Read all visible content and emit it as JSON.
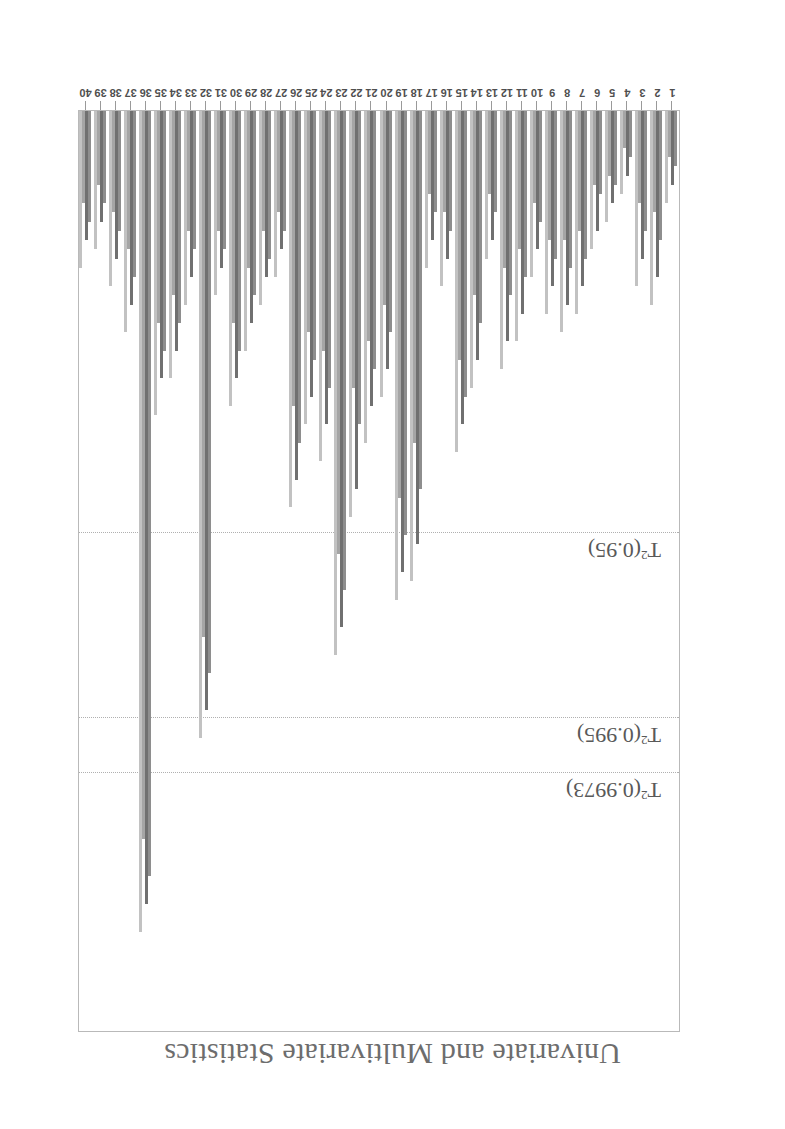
{
  "page": {
    "running_head": "Univariate and Multivariate Statistics",
    "orientation_deg": 180,
    "background": "#ffffff",
    "ink_color": "#5a5a5a"
  },
  "chart_data": {
    "type": "bar",
    "title": "",
    "subtitle": "",
    "xlabel": "",
    "ylabel": "",
    "grid": false,
    "legend_position": "none",
    "ylim": [
      0,
      100
    ],
    "xlim": [
      0.5,
      40.5
    ],
    "categories": [
      "1",
      "2",
      "3",
      "4",
      "5",
      "6",
      "7",
      "8",
      "9",
      "10",
      "11",
      "12",
      "13",
      "14",
      "15",
      "16",
      "17",
      "18",
      "19",
      "20",
      "21",
      "22",
      "23",
      "24",
      "25",
      "26",
      "27",
      "28",
      "29",
      "30",
      "31",
      "32",
      "33",
      "34",
      "35",
      "36",
      "37",
      "38",
      "39",
      "40"
    ],
    "series": [
      {
        "name": "bar-1",
        "shade": "#8e8e8e",
        "values": [
          6,
          14,
          13,
          5,
          8,
          9,
          16,
          17,
          16,
          12,
          18,
          20,
          11,
          23,
          31,
          13,
          11,
          41,
          46,
          24,
          28,
          34,
          52,
          30,
          27,
          36,
          13,
          16,
          20,
          26,
          15,
          61,
          15,
          23,
          26,
          83,
          18,
          13,
          10,
          12
        ]
      },
      {
        "name": "bar-2",
        "shade": "#707070",
        "values": [
          8,
          18,
          16,
          7,
          10,
          13,
          19,
          21,
          19,
          15,
          22,
          25,
          14,
          27,
          34,
          16,
          14,
          47,
          50,
          28,
          32,
          41,
          56,
          34,
          31,
          40,
          15,
          18,
          23,
          29,
          17,
          65,
          18,
          26,
          29,
          86,
          21,
          16,
          12,
          14
        ]
      },
      {
        "name": "bar-3",
        "shade": "#a5a5a5",
        "values": [
          5,
          11,
          10,
          4,
          7,
          8,
          13,
          14,
          14,
          10,
          15,
          17,
          9,
          20,
          27,
          11,
          9,
          36,
          42,
          21,
          25,
          30,
          48,
          26,
          24,
          32,
          11,
          13,
          17,
          23,
          13,
          57,
          13,
          20,
          23,
          79,
          15,
          11,
          8,
          10
        ]
      },
      {
        "name": "bar-4",
        "shade": "#c2c2c2",
        "values": [
          10,
          21,
          19,
          9,
          12,
          15,
          22,
          24,
          22,
          18,
          25,
          28,
          16,
          30,
          37,
          19,
          17,
          51,
          53,
          31,
          36,
          44,
          59,
          38,
          34,
          43,
          18,
          21,
          26,
          32,
          20,
          68,
          21,
          29,
          33,
          89,
          24,
          19,
          15,
          17
        ]
      }
    ],
    "control_limits": [
      {
        "name": "T2-0.9973",
        "label": "T²(0.9973)",
        "value": 72,
        "style": "dotted",
        "color": "#b0b0b0"
      },
      {
        "name": "T2-0.995",
        "label": "T²(0.995)",
        "value": 66,
        "style": "dotted",
        "color": "#b0b0b0"
      },
      {
        "name": "T2-0.95",
        "label": "T²(0.95)",
        "value": 46,
        "style": "dotted",
        "color": "#b0b0b0"
      }
    ],
    "limit_label_texts": {
      "l0_base": "T",
      "l0_sup": "2",
      "l0_rest": "(0.9973)",
      "l1_rest": "(0.995)",
      "l2_rest": "(0.95)"
    }
  }
}
